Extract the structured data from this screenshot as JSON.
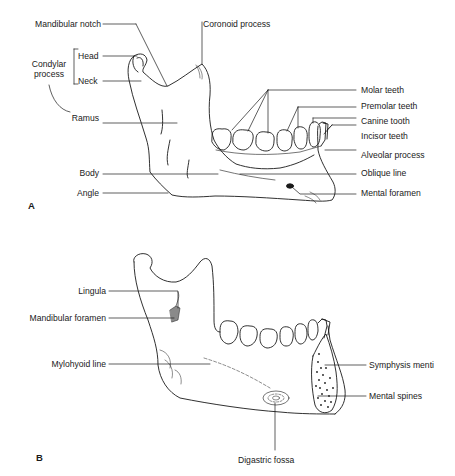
{
  "figure": {
    "panel_a": {
      "letter": "A",
      "labels_left": {
        "mandibular_notch": "Mandibular notch",
        "head": "Head",
        "condylar_process": "Condylar process",
        "condylar_line1": "Condylar",
        "condylar_line2": "process",
        "neck": "Neck",
        "ramus": "Ramus",
        "body": "Body",
        "angle": "Angle"
      },
      "labels_right": {
        "coronoid_process": "Coronoid process",
        "molar_teeth": "Molar teeth",
        "premolar_teeth": "Premolar teeth",
        "canine_tooth": "Canine tooth",
        "incisor_teeth": "Incisor teeth",
        "alveolar_process": "Alveolar process",
        "oblique_line": "Oblique line",
        "mental_foramen": "Mental foramen"
      }
    },
    "panel_b": {
      "letter": "B",
      "labels_left": {
        "lingula": "Lingula",
        "mandibular_foramen": "Mandibular foramen",
        "mylohyoid_line": "Mylohyoid line"
      },
      "labels_right": {
        "symphysis_menti": "Symphysis menti",
        "mental_spines": "Mental spines"
      },
      "labels_bottom": {
        "digastric_fossa": "Digastric fossa"
      }
    },
    "colors": {
      "ink": "#1a1a1a",
      "background": "#ffffff"
    }
  }
}
